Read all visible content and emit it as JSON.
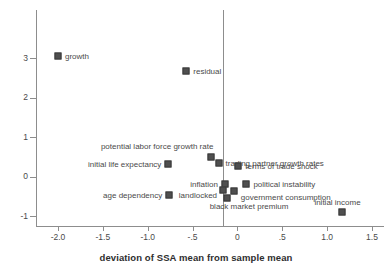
{
  "chart_data": {
    "type": "scatter",
    "title": "",
    "xlabel": "deviation of SSA mean from sample mean",
    "ylabel": "",
    "xlim": [
      -2.15,
      1.6
    ],
    "ylim": [
      -1.35,
      3.55
    ],
    "grid": false,
    "legend": "none",
    "annotations": [
      {
        "text": "zero reference line at x = 0"
      }
    ],
    "xticks": [
      {
        "value": -2.0,
        "label": "-2.0"
      },
      {
        "value": -1.5,
        "label": "-1.5"
      },
      {
        "value": -1.0,
        "label": "-1.0"
      },
      {
        "value": -0.5,
        "label": "-.5"
      },
      {
        "value": 0.0,
        "label": "0"
      },
      {
        "value": 0.5,
        "label": ".5"
      },
      {
        "value": 1.0,
        "label": "1.0"
      },
      {
        "value": 1.5,
        "label": "1.5"
      }
    ],
    "yticks": [
      {
        "value": 3,
        "label": "3"
      },
      {
        "value": 2,
        "label": "2"
      },
      {
        "value": 1,
        "label": "1"
      },
      {
        "value": 0,
        "label": "0"
      },
      {
        "value": -1,
        "label": "-1"
      }
    ],
    "marker_color": "#4f4f4f",
    "axis_color": "#8d8d8d",
    "points": [
      {
        "label": "growth",
        "x": -2.0,
        "y": 3.05,
        "label_side": "right"
      },
      {
        "label": "residual",
        "x": -0.57,
        "y": 2.68,
        "label_side": "right"
      },
      {
        "label": "potential labor force growth rate",
        "x": -0.29,
        "y": 0.5,
        "label_side": "left-above"
      },
      {
        "label": "initial life expectancy",
        "x": -0.77,
        "y": 0.32,
        "label_side": "left"
      },
      {
        "label": "trading partner growth rates",
        "x": -0.21,
        "y": 0.35,
        "label_side": "right"
      },
      {
        "label": "terms of trade shock",
        "x": 0.01,
        "y": 0.27,
        "label_side": "right"
      },
      {
        "label": "inflation",
        "x": -0.14,
        "y": -0.19,
        "label_side": "left"
      },
      {
        "label": "political instability",
        "x": 0.1,
        "y": -0.18,
        "label_side": "right"
      },
      {
        "label": "age dependency",
        "x": -0.76,
        "y": -0.48,
        "label_side": "left"
      },
      {
        "label": "landlocked",
        "x": -0.16,
        "y": -0.33,
        "label_side": "left-below"
      },
      {
        "label": "government consumption",
        "x": -0.04,
        "y": -0.36,
        "label_side": "right-below"
      },
      {
        "label": "black market premium",
        "x": -0.12,
        "y": -0.55,
        "label_side": "below"
      },
      {
        "label": "initial income",
        "x": 1.17,
        "y": -0.9,
        "label_side": "above"
      }
    ]
  }
}
